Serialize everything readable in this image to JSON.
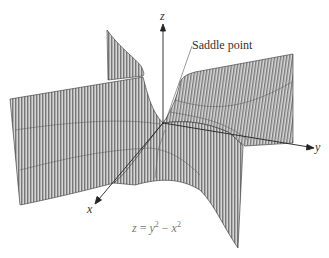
{
  "figure": {
    "equation": {
      "lhs": "z",
      "eq": " = ",
      "term1_base": "y",
      "term1_exp": "2",
      "minus": " − ",
      "term2_base": "x",
      "term2_exp": "2"
    },
    "annotation": "Saddle point",
    "axes": {
      "x_label": "x",
      "y_label": "y",
      "z_label": "z"
    },
    "colors": {
      "surface_fill": "#d4d4d4",
      "mesh_lines": "#3a3a3a",
      "axes": "#222222",
      "annotation_line": "#555555",
      "equation_text": "#777777"
    }
  }
}
